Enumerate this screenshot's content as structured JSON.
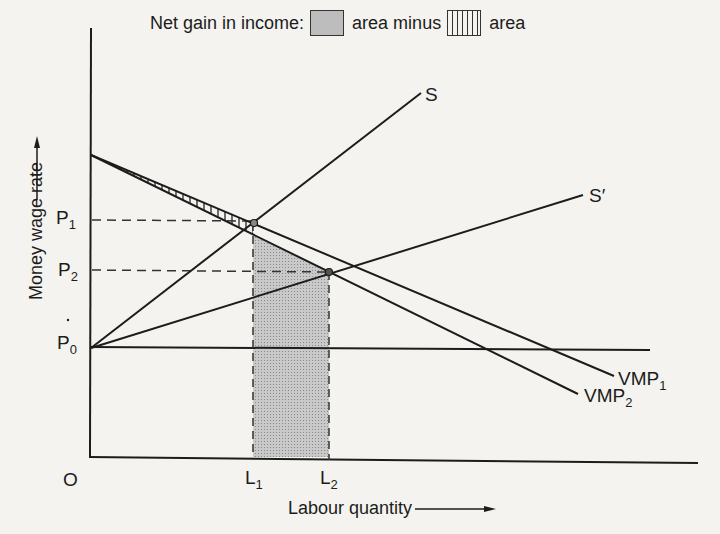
{
  "legend": {
    "prefix": "Net gain in income:",
    "shaded_label": "area minus",
    "hatched_label": "area"
  },
  "axes": {
    "y_label": "Money wage rate",
    "x_label": "Labour quantity",
    "origin": "O"
  },
  "price_labels": {
    "p1": "P",
    "p1_sub": "1",
    "p2": "P",
    "p2_sub": "2",
    "p0": "P",
    "p0_sub": "0"
  },
  "quantity_labels": {
    "l1": "L",
    "l1_sub": "1",
    "l2": "L",
    "l2_sub": "2"
  },
  "curve_labels": {
    "s": "S",
    "s_prime": "S′",
    "vmp1": "VMP",
    "vmp1_sub": "1",
    "vmp2": "VMP",
    "vmp2_sub": "2"
  },
  "colors": {
    "line": "#1c1c1c",
    "shade": "#bdbdbd",
    "background": "#f4f3ef"
  }
}
